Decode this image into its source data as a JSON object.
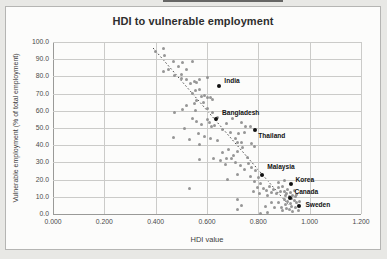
{
  "page": {
    "artifact_note": "dark line fragment at top of scanned image"
  },
  "chart_data": {
    "type": "scatter",
    "title": "HDI to vulnerable employment",
    "xlabel": "HDI value",
    "ylabel": "Vulnerable employment (% of total employment)",
    "xlim": [
      0,
      1.2
    ],
    "ylim": [
      0,
      100
    ],
    "grid": true,
    "legend": "none",
    "xticks": {
      "values": [
        0,
        0.2,
        0.4,
        0.6,
        0.8,
        1.0,
        1.2
      ],
      "labels": [
        "0.000",
        "0.200",
        "0.400",
        "0.600",
        "0.800",
        "1.000",
        "1.200"
      ]
    },
    "yticks": {
      "values": [
        0,
        10,
        20,
        30,
        40,
        50,
        60,
        70,
        80,
        90,
        100
      ],
      "labels": [
        "0.0",
        "10.0",
        "20.0",
        "30.0",
        "40.0",
        "50.0",
        "60.0",
        "70.0",
        "80.0",
        "90.0",
        "100.0"
      ]
    },
    "trendline": {
      "style": "dotted",
      "color": "#4a4a4a",
      "x1": 0.39,
      "y1": 96.5,
      "x2": 0.916,
      "y2": 5.6
    },
    "highlighted_points": [
      {
        "label": "India",
        "x": 0.648,
        "y": 74.5,
        "label_dx": 5,
        "label_dy": -9
      },
      {
        "label": "Bangladesh",
        "x": 0.635,
        "y": 55.0,
        "label_dx": 6,
        "label_dy": -10
      },
      {
        "label": "Thailand",
        "x": 0.788,
        "y": 48.6,
        "label_dx": 3,
        "label_dy": 2
      },
      {
        "label": "Malaysia",
        "x": 0.815,
        "y": 22.9,
        "label_dx": 5,
        "label_dy": -12
      },
      {
        "label": "Korea",
        "x": 0.929,
        "y": 17.3,
        "label_dx": 4,
        "label_dy": -8
      },
      {
        "label": "Canada",
        "x": 0.925,
        "y": 9.3,
        "label_dx": 4,
        "label_dy": -10
      },
      {
        "label": "Sweden",
        "x": 0.96,
        "y": 4.5,
        "label_dx": 6,
        "label_dy": -5
      }
    ],
    "scatter_color": "#8d8d8d",
    "highlight_color": "#111111",
    "points": [
      [
        0.43,
        96
      ],
      [
        0.435,
        92
      ],
      [
        0.4,
        94.5
      ],
      [
        0.45,
        84
      ],
      [
        0.43,
        83
      ],
      [
        0.47,
        88.5
      ],
      [
        0.49,
        86
      ],
      [
        0.505,
        88
      ],
      [
        0.545,
        88.5
      ],
      [
        0.52,
        84
      ],
      [
        0.5,
        81
      ],
      [
        0.475,
        80.5
      ],
      [
        0.5,
        78.5
      ],
      [
        0.52,
        78
      ],
      [
        0.535,
        76
      ],
      [
        0.55,
        77
      ],
      [
        0.56,
        76.5
      ],
      [
        0.57,
        78
      ],
      [
        0.6,
        79.5
      ],
      [
        0.555,
        72
      ],
      [
        0.57,
        72.5
      ],
      [
        0.545,
        70
      ],
      [
        0.58,
        68.5
      ],
      [
        0.59,
        69
      ],
      [
        0.56,
        66
      ],
      [
        0.585,
        65
      ],
      [
        0.55,
        64
      ],
      [
        0.52,
        63
      ],
      [
        0.505,
        60.5
      ],
      [
        0.555,
        60
      ],
      [
        0.6,
        67.5
      ],
      [
        0.615,
        68
      ],
      [
        0.62,
        66.5
      ],
      [
        0.473,
        58.8
      ],
      [
        0.512,
        49.7
      ],
      [
        0.471,
        44.7
      ],
      [
        0.53,
        43.3
      ],
      [
        0.617,
        50.7
      ],
      [
        0.642,
        56.3
      ],
      [
        0.545,
        55.5
      ],
      [
        0.56,
        53.5
      ],
      [
        0.58,
        52
      ],
      [
        0.6,
        55
      ],
      [
        0.61,
        53
      ],
      [
        0.63,
        51.5
      ],
      [
        0.565,
        47
      ],
      [
        0.59,
        45
      ],
      [
        0.615,
        44
      ],
      [
        0.64,
        43
      ],
      [
        0.57,
        40.5
      ],
      [
        0.62,
        59
      ],
      [
        0.6,
        61.5
      ],
      [
        0.691,
        47.2
      ],
      [
        0.72,
        41.3
      ],
      [
        0.733,
        53.4
      ],
      [
        0.751,
        51.1
      ],
      [
        0.768,
        50.7
      ],
      [
        0.746,
        47.2
      ],
      [
        0.723,
        46.8
      ],
      [
        0.712,
        44.1
      ],
      [
        0.733,
        41.4
      ],
      [
        0.772,
        40.8
      ],
      [
        0.785,
        39
      ],
      [
        0.7,
        55.5
      ],
      [
        0.675,
        52.5
      ],
      [
        0.66,
        49
      ],
      [
        0.57,
        31.7
      ],
      [
        0.625,
        32
      ],
      [
        0.652,
        30.9
      ],
      [
        0.674,
        28.8
      ],
      [
        0.694,
        32
      ],
      [
        0.717,
        22.9
      ],
      [
        0.681,
        20
      ],
      [
        0.74,
        38.4
      ],
      [
        0.72,
        36.5
      ],
      [
        0.704,
        34
      ],
      [
        0.759,
        32.6
      ],
      [
        0.675,
        32.4
      ],
      [
        0.66,
        36
      ],
      [
        0.685,
        37.5
      ],
      [
        0.71,
        30
      ],
      [
        0.73,
        28
      ],
      [
        0.745,
        26
      ],
      [
        0.76,
        29.5
      ],
      [
        0.775,
        27
      ],
      [
        0.79,
        25.5
      ],
      [
        0.77,
        22
      ],
      [
        0.785,
        19
      ],
      [
        0.8,
        21
      ],
      [
        0.81,
        18
      ],
      [
        0.795,
        15.5
      ],
      [
        0.78,
        13
      ],
      [
        0.805,
        12
      ],
      [
        0.82,
        15
      ],
      [
        0.83,
        13.5
      ],
      [
        0.845,
        16
      ],
      [
        0.85,
        12.5
      ],
      [
        0.835,
        10.5
      ],
      [
        0.86,
        14
      ],
      [
        0.87,
        12
      ],
      [
        0.88,
        15.5
      ],
      [
        0.885,
        13
      ],
      [
        0.72,
        8.7
      ],
      [
        0.733,
        4.9
      ],
      [
        0.72,
        2.6
      ],
      [
        0.81,
        0.5
      ],
      [
        0.827,
        4.5
      ],
      [
        0.837,
        1
      ],
      [
        0.85,
        6.8
      ],
      [
        0.863,
        3.5
      ],
      [
        0.902,
        8.4
      ],
      [
        0.88,
        6.5
      ],
      [
        0.89,
        4
      ],
      [
        0.895,
        2
      ],
      [
        0.905,
        5.5
      ],
      [
        0.91,
        3
      ],
      [
        0.915,
        7
      ],
      [
        0.92,
        2.5
      ],
      [
        0.925,
        6
      ],
      [
        0.93,
        4.5
      ],
      [
        0.935,
        1.5
      ],
      [
        0.94,
        8
      ],
      [
        0.945,
        3.5
      ],
      [
        0.95,
        6.5
      ],
      [
        0.955,
        2
      ],
      [
        0.96,
        7.5
      ],
      [
        0.88,
        18.5
      ],
      [
        0.895,
        16
      ],
      [
        0.9,
        13
      ],
      [
        0.905,
        10.5
      ],
      [
        0.91,
        12
      ],
      [
        0.915,
        14.5
      ],
      [
        0.92,
        10
      ],
      [
        0.925,
        12.5
      ],
      [
        0.93,
        9
      ],
      [
        0.935,
        11
      ],
      [
        0.94,
        13.5
      ],
      [
        0.945,
        10
      ],
      [
        0.95,
        11.5
      ],
      [
        0.9,
        19.5
      ],
      [
        0.53,
        14.8
      ]
    ]
  }
}
